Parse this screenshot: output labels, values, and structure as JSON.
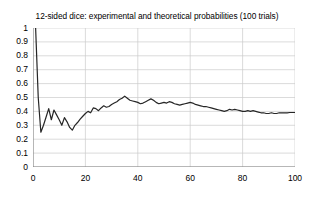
{
  "chart_data": {
    "type": "line",
    "title": "12-sided dice: experimental and theoretical probabilities (100 trials)",
    "xlabel": "",
    "ylabel": "",
    "xlim": [
      0,
      100
    ],
    "ylim": [
      0,
      1
    ],
    "grid": true,
    "legend": "none",
    "x_ticks": [
      0,
      20,
      40,
      60,
      80,
      100
    ],
    "x_tick_labels": [
      "0",
      "20",
      "40",
      "60",
      "80",
      "100"
    ],
    "y_ticks": [
      0,
      0.1,
      0.2,
      0.3,
      0.4,
      0.5,
      0.6,
      0.7,
      0.8,
      0.9,
      1
    ],
    "y_tick_labels": [
      "0",
      "0.1",
      "0.2",
      "0.3",
      "0.4",
      "0.5",
      "0.6",
      "0.7",
      "0.8",
      "0.9",
      "1"
    ],
    "gridline_color": "#cccccc",
    "line_color": "#262626",
    "axis_color": "#808080",
    "series": [
      {
        "name": "experimental probability",
        "x": [
          1,
          2,
          3,
          4,
          5,
          6,
          7,
          8,
          9,
          10,
          11,
          12,
          13,
          14,
          15,
          16,
          17,
          18,
          19,
          20,
          21,
          22,
          23,
          24,
          25,
          26,
          27,
          28,
          29,
          30,
          31,
          32,
          33,
          34,
          35,
          36,
          37,
          38,
          39,
          40,
          41,
          42,
          43,
          44,
          45,
          46,
          47,
          48,
          49,
          50,
          51,
          52,
          53,
          54,
          55,
          56,
          57,
          58,
          59,
          60,
          61,
          62,
          63,
          64,
          65,
          66,
          67,
          68,
          69,
          70,
          71,
          72,
          73,
          74,
          75,
          76,
          77,
          78,
          79,
          80,
          81,
          82,
          83,
          84,
          85,
          86,
          87,
          88,
          89,
          90,
          91,
          92,
          93,
          94,
          95,
          96,
          97,
          98,
          99,
          100
        ],
        "values": [
          1.0,
          0.5,
          0.25,
          0.3,
          0.36,
          0.42,
          0.34,
          0.41,
          0.375,
          0.34,
          0.3,
          0.355,
          0.325,
          0.285,
          0.265,
          0.3,
          0.32,
          0.345,
          0.365,
          0.385,
          0.4,
          0.39,
          0.425,
          0.42,
          0.405,
          0.425,
          0.44,
          0.43,
          0.435,
          0.45,
          0.46,
          0.47,
          0.485,
          0.495,
          0.51,
          0.495,
          0.48,
          0.475,
          0.47,
          0.465,
          0.455,
          0.46,
          0.47,
          0.48,
          0.49,
          0.48,
          0.465,
          0.455,
          0.46,
          0.465,
          0.46,
          0.47,
          0.465,
          0.455,
          0.45,
          0.445,
          0.45,
          0.455,
          0.46,
          0.465,
          0.46,
          0.45,
          0.445,
          0.44,
          0.435,
          0.435,
          0.43,
          0.425,
          0.42,
          0.415,
          0.41,
          0.405,
          0.4,
          0.405,
          0.415,
          0.41,
          0.415,
          0.41,
          0.405,
          0.4,
          0.4,
          0.405,
          0.4,
          0.405,
          0.4,
          0.395,
          0.39,
          0.39,
          0.385,
          0.385,
          0.39,
          0.385,
          0.385,
          0.39,
          0.39,
          0.39,
          0.39,
          0.392,
          0.392,
          0.392
        ]
      }
    ]
  }
}
